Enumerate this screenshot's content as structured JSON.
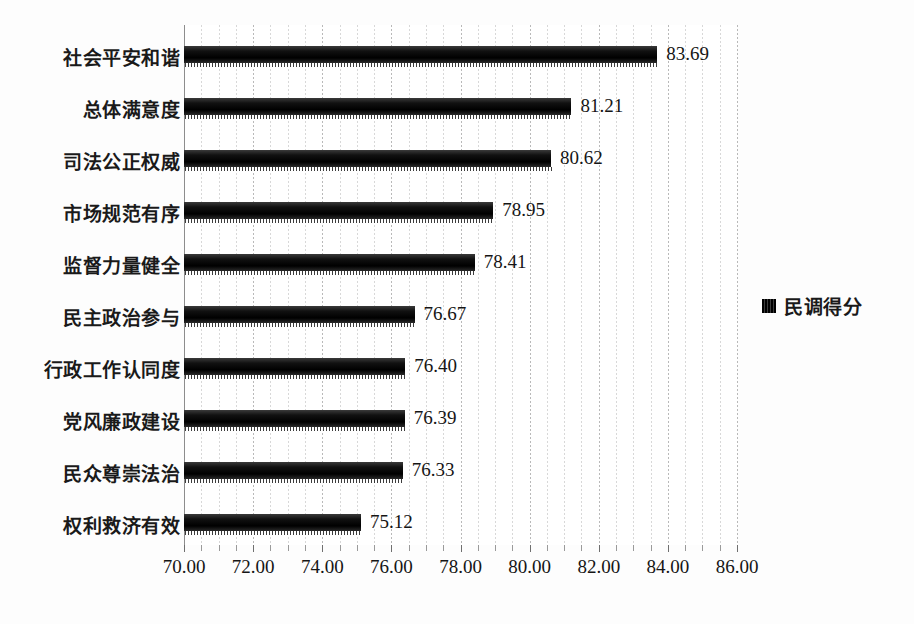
{
  "chart_data": {
    "type": "bar",
    "orientation": "horizontal",
    "title": "",
    "subtitle": "",
    "xlabel": "",
    "ylabel": "",
    "categories": [
      "社会平安和谐",
      "总体满意度",
      "司法公正权威",
      "市场规范有序",
      "监督力量健全",
      "民主政治参与",
      "行政工作认同度",
      "党风廉政建设",
      "民众尊崇法治",
      "权利救济有效"
    ],
    "values": [
      83.69,
      81.21,
      80.62,
      78.95,
      78.41,
      76.67,
      76.4,
      76.39,
      76.33,
      75.12
    ],
    "value_labels": [
      "83.69",
      "81.21",
      "80.62",
      "78.95",
      "78.41",
      "76.67",
      "76.40",
      "76.39",
      "76.33",
      "75.12"
    ],
    "series": [
      {
        "name": "民调得分",
        "values": [
          83.69,
          81.21,
          80.62,
          78.95,
          78.41,
          76.67,
          76.4,
          76.39,
          76.33,
          75.12
        ],
        "color": "#000000"
      }
    ],
    "xlim": [
      70.0,
      86.0
    ],
    "xticks": [
      70.0,
      72.0,
      74.0,
      76.0,
      78.0,
      80.0,
      82.0,
      84.0,
      86.0
    ],
    "xtick_labels": [
      "70.00",
      "72.00",
      "74.00",
      "76.00",
      "78.00",
      "80.00",
      "82.00",
      "84.00",
      "86.00"
    ],
    "minor_tick_step": 0.5,
    "grid": {
      "vertical": true,
      "horizontal": false,
      "style": "dotted",
      "color": "#c8c8c8"
    },
    "legend": {
      "position": "right",
      "entries": [
        {
          "label": "民调得分",
          "marker": "square",
          "color": "#000000"
        }
      ]
    },
    "background_color": "#ffffff",
    "bar_color": "#000000"
  },
  "legend": {
    "label": "民调得分",
    "swatch_name": "legend-swatch-black"
  }
}
